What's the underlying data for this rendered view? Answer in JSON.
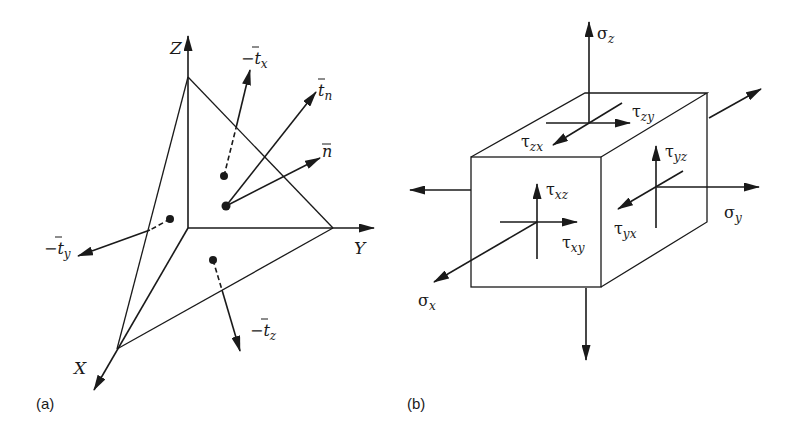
{
  "figure": {
    "panel_a": {
      "caption": "(a)",
      "description": "Tetrahedron at origin with traction vectors on faces",
      "axes": {
        "x": "X",
        "y": "Y",
        "z": "Z"
      },
      "vectors": {
        "neg_tx": {
          "minus": "−",
          "base": "t",
          "sub": "x"
        },
        "tn": {
          "base": "t",
          "sub": "n"
        },
        "n": {
          "base": "n"
        },
        "neg_ty": {
          "minus": "−",
          "base": "t",
          "sub": "y"
        },
        "neg_tz": {
          "minus": "−",
          "base": "t",
          "sub": "z"
        }
      }
    },
    "panel_b": {
      "caption": "(b)",
      "description": "Cubic stress element with normal and shear stress components",
      "normal_stresses": {
        "sigma_x": {
          "base": "σ",
          "sub": "x"
        },
        "sigma_y": {
          "base": "σ",
          "sub": "y"
        },
        "sigma_z": {
          "base": "σ",
          "sub": "z"
        }
      },
      "shear_stresses": {
        "tau_xy": {
          "base": "τ",
          "sub": "xy"
        },
        "tau_xz": {
          "base": "τ",
          "sub": "xz"
        },
        "tau_yx": {
          "base": "τ",
          "sub": "yx"
        },
        "tau_yz": {
          "base": "τ",
          "sub": "yz"
        },
        "tau_zx": {
          "base": "τ",
          "sub": "zx"
        },
        "tau_zy": {
          "base": "τ",
          "sub": "zy"
        }
      }
    }
  }
}
